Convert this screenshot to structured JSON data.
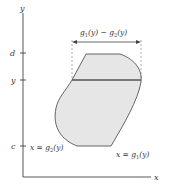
{
  "diagram": {
    "axes": {
      "x_label": "x",
      "y_label": "y"
    },
    "y_ticks": [
      {
        "label": "d",
        "y": 53
      },
      {
        "label": "y",
        "y": 80
      },
      {
        "label": "c",
        "y": 146
      }
    ],
    "width_label": {
      "g1": "g",
      "sub1": "1",
      "mid": "(y) − ",
      "g2": "g",
      "sub2": "2",
      "end": "(y)"
    },
    "left_curve_label": {
      "prefix": "x = g",
      "sub": "2",
      "suffix": "(y)"
    },
    "right_curve_label": {
      "prefix": "x = g",
      "sub": "1",
      "suffix": "(y)"
    },
    "colors": {
      "region_fill": "#e6e6e6",
      "stroke": "#444444",
      "text": "#333333"
    }
  }
}
